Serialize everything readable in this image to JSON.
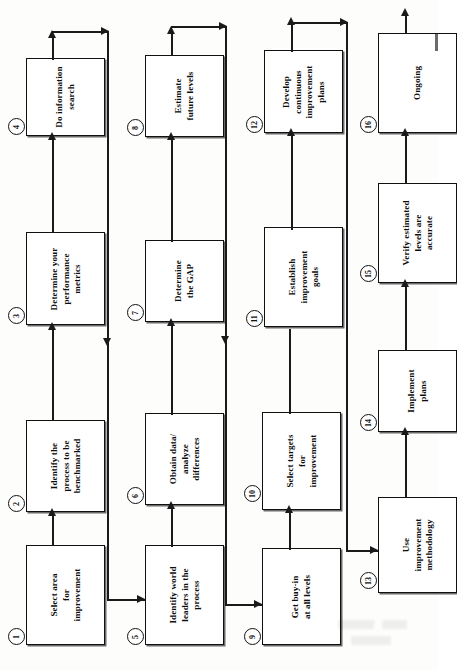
{
  "diagram": {
    "orientation": "rotated-90-ccw",
    "accent_color": "#1a1a1a",
    "box_fill": "#ffffff"
  },
  "chart_data": {
    "type": "diagram",
    "layout": "4x4 serpentine grid, text rotated 90 degrees counter-clockwise",
    "steps": [
      {
        "n": "1",
        "lines": [
          "Select area",
          "for",
          "improvement"
        ]
      },
      {
        "n": "2",
        "lines": [
          "Identify the",
          "process to be",
          "benchmarked"
        ]
      },
      {
        "n": "3",
        "lines": [
          "Determine your",
          "performance",
          "metrics"
        ]
      },
      {
        "n": "4",
        "lines": [
          "Do information",
          "search"
        ]
      },
      {
        "n": "5",
        "lines": [
          "Identify world",
          "leaders in the",
          "process"
        ]
      },
      {
        "n": "6",
        "lines": [
          "Obtain data/",
          "analyze",
          "differences"
        ]
      },
      {
        "n": "7",
        "lines": [
          "Determine",
          "the GAP"
        ]
      },
      {
        "n": "8",
        "lines": [
          "Estimate",
          "future levels"
        ]
      },
      {
        "n": "9",
        "lines": [
          "Get buy-in",
          "at all levels"
        ]
      },
      {
        "n": "10",
        "lines": [
          "Select targets",
          "for",
          "improvement"
        ]
      },
      {
        "n": "11",
        "lines": [
          "Establish",
          "improvement",
          "goals"
        ]
      },
      {
        "n": "12",
        "lines": [
          "Develop",
          "continuous",
          "improvement",
          "plans"
        ]
      },
      {
        "n": "13",
        "lines": [
          "Use",
          "improvement",
          "methodology"
        ]
      },
      {
        "n": "14",
        "lines": [
          "Implement",
          "plans"
        ]
      },
      {
        "n": "15",
        "lines": [
          "Verify estimated",
          "levels are",
          "accurate"
        ]
      },
      {
        "n": "16",
        "lines": [
          "Ongoing"
        ]
      }
    ],
    "connections": [
      "1 -> 2",
      "2 -> 3",
      "3 -> 4",
      "4 -> 5 (wrap)",
      "5 -> 6",
      "6 -> 7",
      "7 -> 8",
      "8 -> 9 (wrap)",
      "9 -> 10",
      "10 -> 11",
      "11 -> 12",
      "12 -> 13 (wrap)",
      "13 -> 14",
      "14 -> 15",
      "15 -> 16"
    ]
  }
}
